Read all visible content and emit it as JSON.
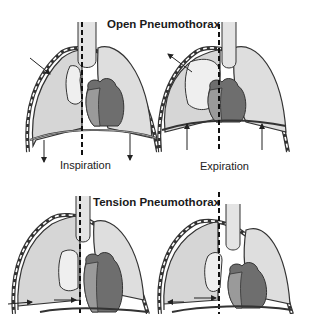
{
  "diagram": {
    "panels": [
      {
        "title": "Open Pneumothorax",
        "phases": [
          {
            "label": "Inspiration",
            "air_flow": "into chest wall wound",
            "mediastinum_shift": "toward unaffected side"
          },
          {
            "label": "Expiration",
            "air_flow": "out of chest wall wound",
            "mediastinum_shift": "toward affected side"
          }
        ]
      },
      {
        "title": "Tension Pneumothorax",
        "phases": [
          {
            "label": "Inspiration",
            "air_flow": "into pleural space",
            "mediastinum_shift": "toward unaffected side"
          },
          {
            "label": "Expiration",
            "air_flow": "trapped, one-way valve",
            "mediastinum_shift": "remains shifted"
          }
        ]
      }
    ],
    "colors": {
      "lung_fill": "#d6d6d6",
      "collapsed_lung": "#e8e8e8",
      "heart_dark": "#6e6e6e",
      "heart_light": "#9a9a9a",
      "outline": "#333333",
      "background": "#ffffff"
    }
  }
}
